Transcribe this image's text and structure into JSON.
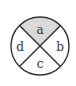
{
  "diagram": {
    "type": "circle-divided-into-four-sectors",
    "sectors": [
      {
        "id": "a",
        "label": "a",
        "position": "top",
        "shaded": true
      },
      {
        "id": "b",
        "label": "b",
        "position": "right",
        "shaded": false
      },
      {
        "id": "c",
        "label": "c",
        "position": "bottom",
        "shaded": false
      },
      {
        "id": "d",
        "label": "d",
        "position": "left",
        "shaded": false
      }
    ],
    "colors": {
      "stroke": "#333333",
      "shaded_fill": "#d9d9d9",
      "unshaded_fill": "#ffffff"
    }
  }
}
